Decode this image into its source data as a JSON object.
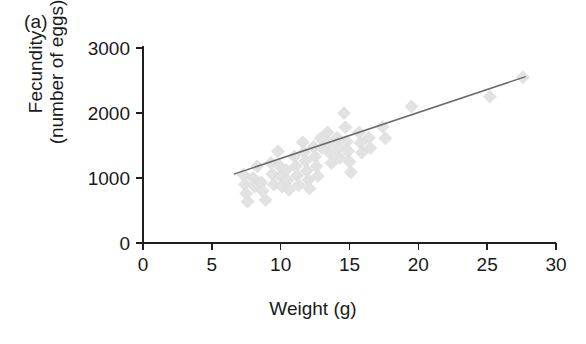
{
  "figure": {
    "panel_label": "(a)",
    "background_color": "#ffffff",
    "text_color": "#1a1a1a"
  },
  "chart_data": {
    "type": "scatter",
    "title": "",
    "subtitle": "",
    "xlabel": "Weight (g)",
    "ylabel": "Fecundity\n(number of eggs)",
    "ylabel_lines": [
      "Fecundity",
      "(number of eggs)"
    ],
    "xlim": [
      0,
      30
    ],
    "ylim": [
      0,
      3000
    ],
    "xticks": [
      0,
      5,
      10,
      15,
      20,
      25,
      30
    ],
    "xticklabels": [
      "0",
      "5",
      "10",
      "15",
      "20",
      "25",
      "30"
    ],
    "yticks": [
      0,
      1000,
      2000,
      3000
    ],
    "yticklabels": [
      "0",
      "1000",
      "2000",
      "3000"
    ],
    "grid": false,
    "legend": false,
    "legend_position": "none",
    "marker_shape": "diamond",
    "marker_color": "#e2e2e2",
    "marker_size": 13,
    "series": [
      {
        "name": "Weight vs Fecundity",
        "points": [
          [
            7.3,
            1050
          ],
          [
            7.4,
            900
          ],
          [
            7.5,
            760
          ],
          [
            7.6,
            640
          ],
          [
            8.0,
            1000
          ],
          [
            8.1,
            870
          ],
          [
            8.3,
            1180
          ],
          [
            8.6,
            930
          ],
          [
            8.7,
            800
          ],
          [
            8.9,
            660
          ],
          [
            9.3,
            1230
          ],
          [
            9.4,
            1060
          ],
          [
            9.5,
            900
          ],
          [
            9.8,
            1410
          ],
          [
            9.9,
            1190
          ],
          [
            10.0,
            1020
          ],
          [
            10.1,
            870
          ],
          [
            10.4,
            1120
          ],
          [
            10.5,
            960
          ],
          [
            10.6,
            820
          ],
          [
            11.0,
            1330
          ],
          [
            11.1,
            1180
          ],
          [
            11.2,
            1040
          ],
          [
            11.3,
            890
          ],
          [
            11.6,
            1550
          ],
          [
            11.7,
            1400
          ],
          [
            11.8,
            1260
          ],
          [
            11.9,
            1110
          ],
          [
            12.0,
            970
          ],
          [
            12.1,
            840
          ],
          [
            12.4,
            1480
          ],
          [
            12.5,
            1330
          ],
          [
            12.6,
            1180
          ],
          [
            12.7,
            1030
          ],
          [
            12.9,
            1610
          ],
          [
            13.0,
            1460
          ],
          [
            13.4,
            1700
          ],
          [
            13.5,
            1540
          ],
          [
            13.6,
            1380
          ],
          [
            13.7,
            1230
          ],
          [
            14.1,
            1620
          ],
          [
            14.2,
            1470
          ],
          [
            14.3,
            1310
          ],
          [
            14.6,
            2000
          ],
          [
            14.7,
            1780
          ],
          [
            14.8,
            1560
          ],
          [
            14.9,
            1410
          ],
          [
            15.0,
            1250
          ],
          [
            15.1,
            1090
          ],
          [
            15.7,
            1700
          ],
          [
            15.8,
            1540
          ],
          [
            15.9,
            1390
          ],
          [
            16.4,
            1620
          ],
          [
            16.5,
            1460
          ],
          [
            17.4,
            1790
          ],
          [
            17.6,
            1610
          ],
          [
            19.5,
            2100
          ],
          [
            25.2,
            2250
          ],
          [
            27.6,
            2550
          ]
        ]
      }
    ],
    "trendline": {
      "type": "linear-fit",
      "x_start": 6.6,
      "y_start": 1060,
      "x_end": 27.8,
      "y_end": 2560,
      "color": "#6b6b6b"
    }
  }
}
